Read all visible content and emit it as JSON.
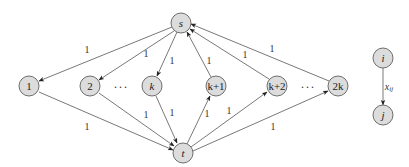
{
  "diagram": {
    "type": "directed-graph",
    "nodes": {
      "s": {
        "label": "s",
        "x": 181,
        "y": 23,
        "italic": true
      },
      "t": {
        "label": "t",
        "x": 183,
        "y": 153,
        "italic": true
      },
      "n1": {
        "label": "1",
        "x": 29,
        "y": 86,
        "italic": false
      },
      "n2": {
        "label": "2",
        "x": 90,
        "y": 86,
        "italic": false
      },
      "nk": {
        "label": "k",
        "x": 152,
        "y": 86,
        "italic": true
      },
      "nk1": {
        "label": "k+1",
        "x": 216,
        "y": 86,
        "italic": false
      },
      "nk2": {
        "label": "k+2",
        "x": 277,
        "y": 86,
        "italic": false
      },
      "n2k": {
        "label": "2k",
        "x": 338,
        "y": 86,
        "italic": false
      },
      "i": {
        "label": "i",
        "x": 383,
        "y": 58,
        "italic": true
      },
      "j": {
        "label": "j",
        "x": 383,
        "y": 115,
        "italic": true
      }
    },
    "dots": [
      "···",
      "···"
    ],
    "edges": [
      {
        "from": "s",
        "to": "n1",
        "label": "1"
      },
      {
        "from": "s",
        "to": "n2",
        "label": "1"
      },
      {
        "from": "s",
        "to": "nk",
        "label": "1"
      },
      {
        "from": "n1",
        "to": "t",
        "label": "1"
      },
      {
        "from": "n2",
        "to": "t",
        "label": "1"
      },
      {
        "from": "nk",
        "to": "t",
        "label": "1"
      },
      {
        "from": "t",
        "to": "nk1",
        "label": "1"
      },
      {
        "from": "t",
        "to": "nk2",
        "label": "1"
      },
      {
        "from": "t",
        "to": "n2k",
        "label": "1"
      },
      {
        "from": "nk1",
        "to": "s",
        "label": "1"
      },
      {
        "from": "nk2",
        "to": "s",
        "label": "1"
      },
      {
        "from": "n2k",
        "to": "s",
        "label": "1"
      },
      {
        "from": "i",
        "to": "j",
        "label": "x_ij"
      }
    ],
    "legend": {
      "from": "i",
      "to": "j",
      "edge_label_main": "x",
      "edge_label_sub": "ij"
    },
    "colors": {
      "node_fill": "#dcdcdc",
      "node_stroke": "#6e6e6e",
      "edge": "#555555"
    }
  }
}
